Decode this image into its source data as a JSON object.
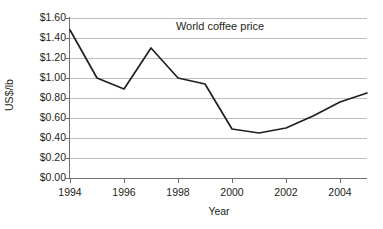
{
  "chart_data": {
    "type": "line",
    "title": "World coffee price",
    "xlabel": "Year",
    "ylabel": "US$/lb",
    "x": [
      1994,
      1995,
      1996,
      1997,
      1998,
      1999,
      2000,
      2001,
      2002,
      2003,
      2004,
      2005
    ],
    "values": [
      1.48,
      1.0,
      0.89,
      1.3,
      1.0,
      0.94,
      0.49,
      0.45,
      0.5,
      0.62,
      0.76,
      0.85
    ],
    "series": [
      {
        "name": "World coffee price",
        "values": [
          1.48,
          1.0,
          0.89,
          1.3,
          1.0,
          0.94,
          0.49,
          0.45,
          0.5,
          0.62,
          0.76,
          0.85
        ]
      }
    ],
    "xlim": [
      1994,
      2005
    ],
    "ylim": [
      0.0,
      1.6
    ],
    "ytick_labels": [
      "$0.00",
      "$0.20",
      "$0.40",
      "$0.60",
      "$0.80",
      "$1.00",
      "$1.20",
      "$1.40",
      "$1.60"
    ],
    "ytick_values": [
      0.0,
      0.2,
      0.4,
      0.6,
      0.8,
      1.0,
      1.2,
      1.4,
      1.6
    ],
    "xtick_labels": [
      "1994",
      "1996",
      "1998",
      "2000",
      "2002",
      "2004"
    ],
    "xtick_values": [
      1994,
      1996,
      1998,
      2000,
      2002,
      2004
    ],
    "grid": true,
    "legend": "none",
    "line_color": "#231f20",
    "grid_color": "#bcbec0",
    "axis_color": "#6d6e71",
    "background_color": "#ffffff"
  }
}
